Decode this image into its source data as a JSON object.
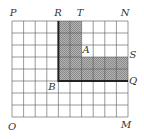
{
  "figure": {
    "grid": {
      "columns": 10,
      "rows": 8,
      "origin_x": 12,
      "origin_y": 21,
      "cell_w": 11.6,
      "cell_h": 12.0,
      "line_color": "#555555"
    },
    "shaded_region": {
      "fill": "#9a9a9a",
      "vertical_arm": {
        "col_start": 4,
        "col_end": 6,
        "row_start": 0,
        "row_end": 3
      },
      "horizontal_arm": {
        "col_start": 4,
        "col_end": 10,
        "row_start": 3,
        "row_end": 5
      }
    },
    "thick_border": {
      "color": "#222222",
      "points": [
        [
          4,
          0
        ],
        [
          4,
          5
        ],
        [
          10,
          5
        ]
      ]
    },
    "labels": [
      {
        "text": "P",
        "x": 13,
        "y": 16
      },
      {
        "text": "R",
        "x": 58,
        "y": 16
      },
      {
        "text": "T",
        "x": 80,
        "y": 16
      },
      {
        "text": "N",
        "x": 125,
        "y": 16
      },
      {
        "text": "A",
        "x": 86,
        "y": 53
      },
      {
        "text": "S",
        "x": 133,
        "y": 58
      },
      {
        "text": "Q",
        "x": 133,
        "y": 84
      },
      {
        "text": "B",
        "x": 52,
        "y": 90
      },
      {
        "text": "O",
        "x": 12,
        "y": 130
      },
      {
        "text": "M",
        "x": 126,
        "y": 128
      }
    ]
  }
}
